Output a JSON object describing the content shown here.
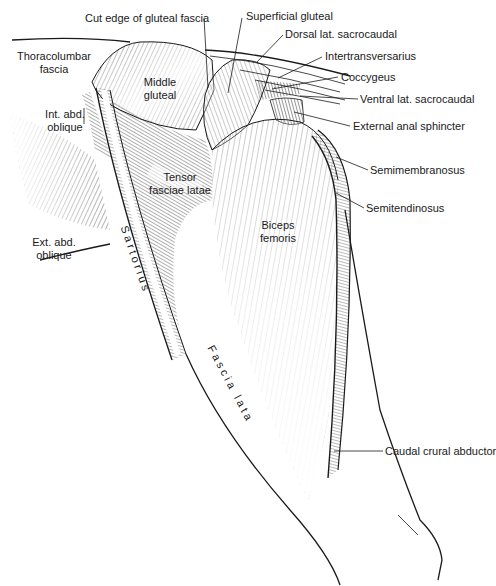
{
  "figure": {
    "labels": {
      "cut_edge": "Cut edge of gluteal fascia",
      "superficial_gluteal": "Superficial gluteal",
      "dorsal_lat_sacrocaudal": "Dorsal lat. sacrocaudal",
      "intertransversarius": "Intertransversarius",
      "coccygeus": "Coccygeus",
      "ventral_lat_sacrocaudal": "Ventral lat. sacrocaudal",
      "external_anal_sphincter": "External anal sphincter",
      "thoracolumbar_fascia_1": "Thoracolumbar",
      "thoracolumbar_fascia_2": "fascia",
      "middle_gluteal_1": "Middle",
      "middle_gluteal_2": "gluteal",
      "int_abd_oblique_1": "Int. abd.",
      "int_abd_oblique_2": "oblique",
      "tensor_1": "Tensor",
      "tensor_2": "fasciae latae",
      "ext_abd_oblique_1": "Ext. abd.",
      "ext_abd_oblique_2": "oblique",
      "sartorius": "Sartorius",
      "biceps_1": "Biceps",
      "biceps_2": "femoris",
      "semimembranosus": "Semimembranosus",
      "semitendinosus": "Semitendinosus",
      "fascia_lata": "Fascia lata",
      "caudal_crural_abductor": "Caudal crural abductor"
    },
    "colors": {
      "ink": "#1a1a1a",
      "background": "#ffffff"
    }
  }
}
